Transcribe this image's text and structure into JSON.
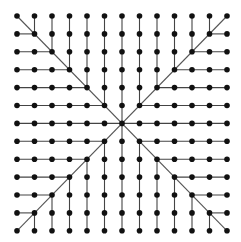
{
  "diagram": {
    "type": "grid-graph",
    "rows": 13,
    "cols": 13,
    "origin": {
      "x": 17,
      "y": 16
    },
    "spacing": {
      "x": 17.5,
      "y": 17.9
    },
    "node_radius": 2.8,
    "colors": {
      "background": "#ffffff",
      "node": "#111111",
      "edge": "#444444",
      "diagonal": "#555555"
    },
    "edge_width": 1.1
  }
}
